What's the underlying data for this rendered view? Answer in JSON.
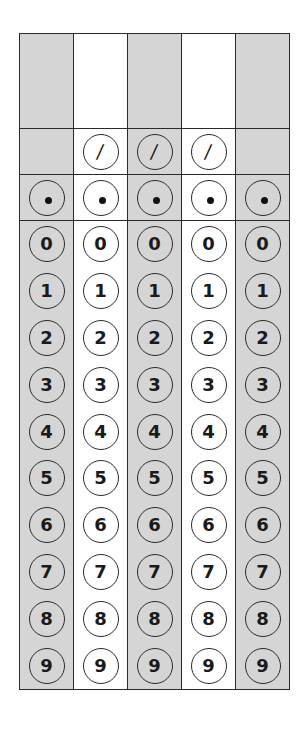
{
  "form": {
    "type": "grid-in answer sheet",
    "columns": 5,
    "column_shading": [
      "#d5d5d5",
      "#ffffff",
      "#d5d5d5",
      "#ffffff",
      "#d5d5d5"
    ],
    "border_color": "#2a2a2a",
    "entry_boxes": [
      "",
      "",
      "",
      "",
      ""
    ],
    "fraction_row": {
      "symbol": "/",
      "present_in_columns": [
        false,
        true,
        true,
        true,
        false
      ]
    },
    "decimal_row": {
      "symbol": "•",
      "present_in_columns": [
        true,
        true,
        true,
        true,
        true
      ]
    },
    "digits": [
      "0",
      "1",
      "2",
      "3",
      "4",
      "5",
      "6",
      "7",
      "8",
      "9"
    ]
  },
  "cols": [
    {
      "entry": "",
      "slash": null,
      "decimal": "•",
      "digits": [
        "0",
        "1",
        "2",
        "3",
        "4",
        "5",
        "6",
        "7",
        "8",
        "9"
      ]
    },
    {
      "entry": "",
      "slash": "/",
      "decimal": "•",
      "digits": [
        "0",
        "1",
        "2",
        "3",
        "4",
        "5",
        "6",
        "7",
        "8",
        "9"
      ]
    },
    {
      "entry": "",
      "slash": "/",
      "decimal": "•",
      "digits": [
        "0",
        "1",
        "2",
        "3",
        "4",
        "5",
        "6",
        "7",
        "8",
        "9"
      ]
    },
    {
      "entry": "",
      "slash": "/",
      "decimal": "•",
      "digits": [
        "0",
        "1",
        "2",
        "3",
        "4",
        "5",
        "6",
        "7",
        "8",
        "9"
      ]
    },
    {
      "entry": "",
      "slash": null,
      "decimal": "•",
      "digits": [
        "0",
        "1",
        "2",
        "3",
        "4",
        "5",
        "6",
        "7",
        "8",
        "9"
      ]
    }
  ]
}
